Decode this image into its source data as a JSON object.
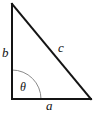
{
  "figure": {
    "name": "right-triangle-trigonometry-diagram",
    "background_color": "#ffffff",
    "stroke_color": "#141414",
    "arc_color": "#8a8a8a",
    "stroke_width": 2,
    "arc_stroke_width": 1,
    "width": 98,
    "height": 116
  },
  "geometry": {
    "vertices": {
      "top": {
        "x": 12,
        "y": 4
      },
      "bottom_left": {
        "x": 12,
        "y": 99
      },
      "bottom_right": {
        "x": 91,
        "y": 99
      }
    },
    "angle_arc": {
      "center_x": 12,
      "center_y": 99,
      "radius": 29,
      "start_x": 41,
      "start_y": 99,
      "end_x": 12,
      "end_y": 70
    },
    "path": "M 12 4 L 12 99 L 91 99 Z"
  },
  "labels": {
    "vertical_leg": "b",
    "hypotenuse": "c",
    "horizontal_leg": "a",
    "angle": "θ"
  }
}
